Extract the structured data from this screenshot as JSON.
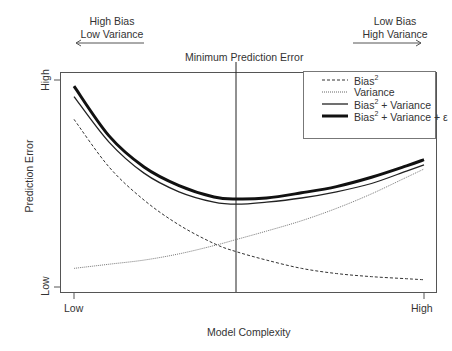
{
  "chart_data": {
    "type": "line",
    "title": "Minimum Prediction Error",
    "xlabel": "Model Complexity",
    "ylabel": "Prediction Error",
    "x_ticks": [
      "Low",
      "High"
    ],
    "y_ticks": [
      "Low",
      "High"
    ],
    "xlim": [
      0,
      1
    ],
    "ylim": [
      0,
      1
    ],
    "grid": false,
    "legend_position": "top-right",
    "annotations": {
      "left": {
        "line1": "High Bias",
        "line2": "Low Variance",
        "arrow": "left"
      },
      "right": {
        "line1": "Low Bias",
        "line2": "High Variance",
        "arrow": "right"
      },
      "vline": {
        "label": "Minimum Prediction Error",
        "x": 0.465
      }
    },
    "x": [
      0.0,
      0.1,
      0.2,
      0.3,
      0.4,
      0.465,
      0.55,
      0.65,
      0.75,
      0.85,
      0.95,
      1.0
    ],
    "series": [
      {
        "name": "Bias^2",
        "style": "dashed",
        "values": [
          0.81,
          0.58,
          0.42,
          0.3,
          0.21,
          0.17,
          0.13,
          0.09,
          0.065,
          0.05,
          0.04,
          0.035
        ]
      },
      {
        "name": "Variance",
        "style": "dotted",
        "values": [
          0.09,
          0.11,
          0.13,
          0.16,
          0.2,
          0.23,
          0.27,
          0.32,
          0.38,
          0.45,
          0.53,
          0.57
        ]
      },
      {
        "name": "Bias^2 + Variance",
        "style": "solid",
        "values": [
          0.92,
          0.7,
          0.55,
          0.46,
          0.41,
          0.4,
          0.41,
          0.43,
          0.46,
          0.5,
          0.56,
          0.59
        ]
      },
      {
        "name": "Bias^2 + Variance + ε",
        "style": "solid-thick",
        "values": [
          0.97,
          0.73,
          0.58,
          0.49,
          0.435,
          0.425,
          0.43,
          0.455,
          0.485,
          0.53,
          0.585,
          0.615
        ]
      }
    ]
  },
  "legend": {
    "items": [
      {
        "label": "Bias",
        "sup": "2",
        "suffix": ""
      },
      {
        "label": "Variance",
        "sup": "",
        "suffix": ""
      },
      {
        "label": "Bias",
        "sup": "2",
        "suffix": " + Variance"
      },
      {
        "label": "Bias",
        "sup": "2",
        "suffix": " + Variance + ε"
      }
    ]
  }
}
